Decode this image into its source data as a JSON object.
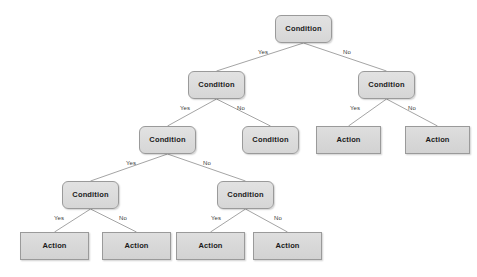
{
  "diagram": {
    "type": "decision-tree",
    "background_color": "#ffffff",
    "node_fill_color": "#dcdcdc",
    "node_border_color": "#9a9a9a",
    "edge_color": "#9a9a9a",
    "text_color": "#1a1a1a",
    "labels": {
      "condition": "Condition",
      "action": "Action",
      "yes": "Yes",
      "no": "No"
    },
    "nodes": [
      {
        "id": "n1",
        "label": "Condition",
        "shape": "rounded-rect",
        "x": 275,
        "y": 15,
        "w": 57,
        "h": 28,
        "level": 1
      },
      {
        "id": "n2",
        "label": "Condition",
        "shape": "rounded-rect",
        "x": 188,
        "y": 71,
        "w": 57,
        "h": 28,
        "level": 2
      },
      {
        "id": "n3",
        "label": "Condition",
        "shape": "rounded-rect",
        "x": 358,
        "y": 71,
        "w": 57,
        "h": 28,
        "level": 2
      },
      {
        "id": "n4",
        "label": "Condition",
        "shape": "rounded-rect",
        "x": 139,
        "y": 126,
        "w": 57,
        "h": 28,
        "level": 3
      },
      {
        "id": "n5",
        "label": "Condition",
        "shape": "rounded-rect",
        "x": 242,
        "y": 126,
        "w": 57,
        "h": 28,
        "level": 3
      },
      {
        "id": "n6",
        "label": "Action",
        "shape": "rect",
        "x": 316,
        "y": 126,
        "w": 65,
        "h": 28,
        "level": 3
      },
      {
        "id": "n7",
        "label": "Action",
        "shape": "rect",
        "x": 405,
        "y": 126,
        "w": 65,
        "h": 28,
        "level": 3
      },
      {
        "id": "n8",
        "label": "Condition",
        "shape": "rounded-rect",
        "x": 62,
        "y": 181,
        "w": 57,
        "h": 28,
        "level": 4
      },
      {
        "id": "n9",
        "label": "Condition",
        "shape": "rounded-rect",
        "x": 217,
        "y": 181,
        "w": 57,
        "h": 28,
        "level": 4
      },
      {
        "id": "n10",
        "label": "Action",
        "shape": "rect",
        "x": 20,
        "y": 232,
        "w": 69,
        "h": 28,
        "level": 5
      },
      {
        "id": "n11",
        "label": "Action",
        "shape": "rect",
        "x": 102,
        "y": 232,
        "w": 69,
        "h": 28,
        "level": 5
      },
      {
        "id": "n12",
        "label": "Action",
        "shape": "rect",
        "x": 176,
        "y": 232,
        "w": 69,
        "h": 28,
        "level": 5
      },
      {
        "id": "n13",
        "label": "Action",
        "shape": "rect",
        "x": 253,
        "y": 232,
        "w": 69,
        "h": 28,
        "level": 5
      }
    ],
    "edges": [
      {
        "from": "n1",
        "to": "n2",
        "label": "Yes",
        "label_x": 258,
        "label_y": 49
      },
      {
        "from": "n1",
        "to": "n3",
        "label": "No",
        "label_x": 343,
        "label_y": 49
      },
      {
        "from": "n2",
        "to": "n4",
        "label": "Yes",
        "label_x": 180,
        "label_y": 105
      },
      {
        "from": "n2",
        "to": "n5",
        "label": "No",
        "label_x": 237,
        "label_y": 105
      },
      {
        "from": "n3",
        "to": "n6",
        "label": "Yes",
        "label_x": 350,
        "label_y": 105
      },
      {
        "from": "n3",
        "to": "n7",
        "label": "No",
        "label_x": 408,
        "label_y": 105
      },
      {
        "from": "n4",
        "to": "n8",
        "label": "Yes",
        "label_x": 126,
        "label_y": 160
      },
      {
        "from": "n4",
        "to": "n9",
        "label": "No",
        "label_x": 203,
        "label_y": 160
      },
      {
        "from": "n8",
        "to": "n10",
        "label": "Yes",
        "label_x": 54,
        "label_y": 215
      },
      {
        "from": "n8",
        "to": "n11",
        "label": "No",
        "label_x": 119,
        "label_y": 215
      },
      {
        "from": "n9",
        "to": "n12",
        "label": "Yes",
        "label_x": 211,
        "label_y": 215
      },
      {
        "from": "n9",
        "to": "n13",
        "label": "No",
        "label_x": 274,
        "label_y": 215
      }
    ]
  }
}
